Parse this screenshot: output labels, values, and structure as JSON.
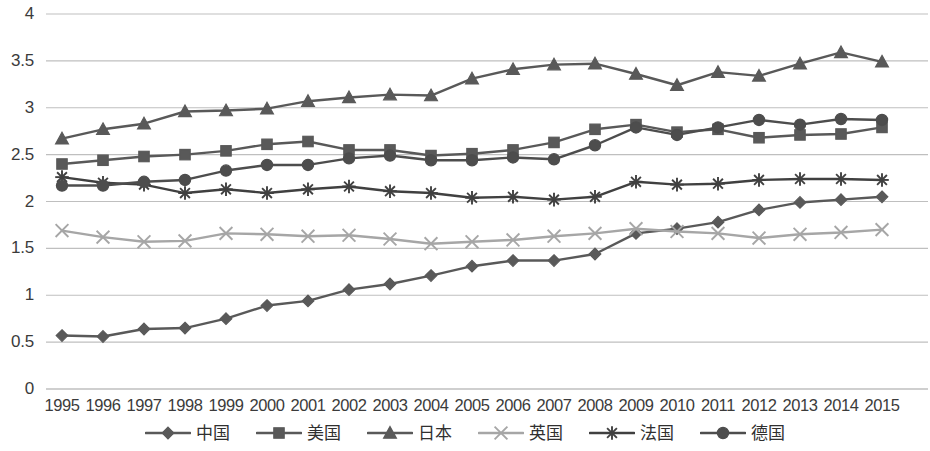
{
  "chart_data": {
    "type": "line",
    "title": "",
    "subtitle": "",
    "xlabel": "",
    "ylabel": "",
    "xlim": [
      1995,
      2015
    ],
    "ylim": [
      0,
      4
    ],
    "ytick_step": 0.5,
    "grid": "horizontal",
    "legend_position": "bottom",
    "categories": [
      "1995",
      "1996",
      "1997",
      "1998",
      "1999",
      "2000",
      "2001",
      "2002",
      "2003",
      "2004",
      "2005",
      "2006",
      "2007",
      "2008",
      "2009",
      "2010",
      "2011",
      "2012",
      "2013",
      "2014",
      "2015"
    ],
    "y_ticks": [
      "0",
      "0.5",
      "1",
      "1.5",
      "2",
      "2.5",
      "3",
      "3.5",
      "4"
    ],
    "series": [
      {
        "name": "中国",
        "marker": "diamond",
        "color": "#595959",
        "values": [
          0.57,
          0.56,
          0.64,
          0.65,
          0.75,
          0.89,
          0.94,
          1.06,
          1.12,
          1.21,
          1.31,
          1.37,
          1.37,
          1.44,
          1.66,
          1.71,
          1.78,
          1.91,
          1.99,
          2.02,
          2.05
        ]
      },
      {
        "name": "美国",
        "marker": "square",
        "color": "#595959",
        "values": [
          2.4,
          2.44,
          2.48,
          2.5,
          2.54,
          2.61,
          2.64,
          2.55,
          2.55,
          2.49,
          2.51,
          2.55,
          2.63,
          2.77,
          2.82,
          2.74,
          2.77,
          2.68,
          2.71,
          2.72,
          2.79
        ]
      },
      {
        "name": "日本",
        "marker": "triangle",
        "color": "#595959",
        "values": [
          2.67,
          2.77,
          2.83,
          2.96,
          2.97,
          2.99,
          3.07,
          3.11,
          3.14,
          3.13,
          3.31,
          3.41,
          3.46,
          3.47,
          3.36,
          3.24,
          3.38,
          3.34,
          3.47,
          3.59,
          3.49
        ]
      },
      {
        "name": "英国",
        "marker": "cross",
        "color": "#a6a6a6",
        "values": [
          1.69,
          1.62,
          1.57,
          1.58,
          1.66,
          1.65,
          1.63,
          1.64,
          1.6,
          1.55,
          1.57,
          1.59,
          1.63,
          1.66,
          1.71,
          1.68,
          1.66,
          1.61,
          1.65,
          1.67,
          1.7
        ]
      },
      {
        "name": "法国",
        "marker": "asterisk",
        "color": "#404040",
        "values": [
          2.26,
          2.2,
          2.18,
          2.09,
          2.13,
          2.09,
          2.13,
          2.16,
          2.11,
          2.09,
          2.04,
          2.05,
          2.02,
          2.05,
          2.21,
          2.18,
          2.19,
          2.23,
          2.24,
          2.24,
          2.23
        ]
      },
      {
        "name": "德国",
        "marker": "circle",
        "color": "#4d4d4d",
        "values": [
          2.17,
          2.17,
          2.21,
          2.23,
          2.33,
          2.39,
          2.39,
          2.46,
          2.49,
          2.44,
          2.44,
          2.47,
          2.45,
          2.6,
          2.79,
          2.71,
          2.79,
          2.87,
          2.82,
          2.88,
          2.87
        ]
      }
    ]
  },
  "legend": {
    "items": [
      {
        "label": "中国",
        "marker": "diamond-marker-icon"
      },
      {
        "label": "美国",
        "marker": "square-marker-icon"
      },
      {
        "label": "日本",
        "marker": "triangle-marker-icon"
      },
      {
        "label": "英国",
        "marker": "cross-marker-icon"
      },
      {
        "label": "法国",
        "marker": "asterisk-marker-icon"
      },
      {
        "label": "德国",
        "marker": "circle-marker-icon"
      }
    ]
  },
  "colors": {
    "gridline": "#bfbfbf",
    "axis_text": "#3b3b3b",
    "plot_background": "#ffffff"
  }
}
